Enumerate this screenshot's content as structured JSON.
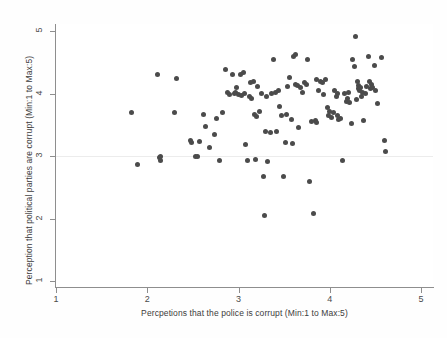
{
  "chart_data": {
    "type": "scatter",
    "title": "",
    "xlabel": "Percpetions that the police is corrupt (Min:1 to Max:5)",
    "ylabel": "Perception that political parties are corrupt (Min:1 to Max:5)",
    "xlim": [
      1,
      5
    ],
    "ylim": [
      1,
      5
    ],
    "xticks": [
      1,
      2,
      3,
      4,
      5
    ],
    "yticks": [
      1,
      2,
      3,
      4,
      5
    ],
    "xtick_labels": [
      "1",
      "2",
      "3",
      "4",
      "5"
    ],
    "ytick_labels": [
      "1",
      "2",
      "3",
      "4",
      "5"
    ],
    "grid": "horizontal-faint-at-3",
    "legend": null,
    "marker": {
      "shape": "circle",
      "color": "#4b4b4b",
      "size_px": 5
    },
    "n_points": 128,
    "points": [
      [
        1.83,
        3.7
      ],
      [
        1.89,
        2.86
      ],
      [
        2.11,
        4.3
      ],
      [
        2.13,
        2.97
      ],
      [
        2.14,
        2.93
      ],
      [
        2.14,
        3.0
      ],
      [
        2.32,
        4.24
      ],
      [
        2.3,
        3.7
      ],
      [
        2.47,
        3.25
      ],
      [
        2.49,
        3.22
      ],
      [
        2.53,
        2.99
      ],
      [
        2.55,
        2.99
      ],
      [
        2.57,
        3.23
      ],
      [
        2.62,
        3.66
      ],
      [
        2.64,
        3.48
      ],
      [
        2.68,
        3.13
      ],
      [
        2.74,
        3.35
      ],
      [
        2.76,
        3.6
      ],
      [
        2.79,
        2.93
      ],
      [
        2.82,
        3.7
      ],
      [
        2.86,
        4.38
      ],
      [
        2.88,
        4.02
      ],
      [
        2.9,
        3.98
      ],
      [
        2.93,
        4.3
      ],
      [
        2.96,
        4.0
      ],
      [
        2.97,
        4.02
      ],
      [
        3.0,
        3.98
      ],
      [
        3.02,
        4.3
      ],
      [
        3.05,
        4.33
      ],
      [
        3.07,
        4.0
      ],
      [
        3.08,
        3.18
      ],
      [
        3.1,
        2.93
      ],
      [
        3.12,
        3.95
      ],
      [
        3.14,
        3.92
      ],
      [
        3.16,
        4.2
      ],
      [
        3.18,
        3.66
      ],
      [
        3.19,
        2.95
      ],
      [
        3.2,
        3.63
      ],
      [
        3.23,
        3.71
      ],
      [
        3.25,
        4.0
      ],
      [
        3.27,
        2.68
      ],
      [
        3.28,
        2.05
      ],
      [
        3.3,
        3.4
      ],
      [
        3.32,
        2.92
      ],
      [
        3.35,
        3.37
      ],
      [
        3.38,
        4.55
      ],
      [
        3.4,
        4.02
      ],
      [
        3.42,
        3.4
      ],
      [
        3.45,
        3.8
      ],
      [
        3.47,
        3.65
      ],
      [
        3.49,
        2.67
      ],
      [
        3.52,
        3.22
      ],
      [
        3.54,
        4.12
      ],
      [
        3.56,
        4.25
      ],
      [
        3.58,
        3.58
      ],
      [
        3.59,
        3.2
      ],
      [
        3.6,
        4.6
      ],
      [
        3.62,
        4.63
      ],
      [
        3.63,
        4.15
      ],
      [
        3.65,
        4.13
      ],
      [
        3.66,
        3.45
      ],
      [
        3.68,
        4.1
      ],
      [
        3.7,
        4.02
      ],
      [
        3.72,
        4.18
      ],
      [
        3.74,
        4.15
      ],
      [
        3.76,
        4.55
      ],
      [
        3.78,
        2.6
      ],
      [
        3.8,
        3.55
      ],
      [
        3.82,
        2.08
      ],
      [
        3.84,
        3.57
      ],
      [
        3.86,
        4.22
      ],
      [
        3.88,
        4.05
      ],
      [
        3.9,
        4.2
      ],
      [
        3.92,
        4.18
      ],
      [
        3.95,
        4.22
      ],
      [
        3.97,
        3.78
      ],
      [
        3.99,
        3.65
      ],
      [
        4.0,
        3.72
      ],
      [
        4.02,
        3.62
      ],
      [
        4.04,
        3.7
      ],
      [
        4.05,
        4.05
      ],
      [
        4.07,
        3.95
      ],
      [
        4.09,
        4.0
      ],
      [
        4.1,
        3.58
      ],
      [
        4.12,
        3.6
      ],
      [
        4.14,
        2.93
      ],
      [
        4.16,
        4.0
      ],
      [
        4.18,
        3.88
      ],
      [
        4.2,
        4.02
      ],
      [
        4.22,
        3.86
      ],
      [
        4.24,
        3.52
      ],
      [
        4.25,
        4.55
      ],
      [
        4.27,
        4.44
      ],
      [
        4.28,
        4.92
      ],
      [
        4.3,
        4.2
      ],
      [
        4.31,
        4.13
      ],
      [
        4.32,
        4.08
      ],
      [
        4.33,
        4.05
      ],
      [
        4.34,
        4.1
      ],
      [
        4.35,
        3.96
      ],
      [
        4.36,
        4.02
      ],
      [
        4.37,
        3.57
      ],
      [
        4.4,
        4.12
      ],
      [
        4.42,
        4.6
      ],
      [
        4.44,
        4.2
      ],
      [
        4.45,
        4.08
      ],
      [
        4.46,
        4.14
      ],
      [
        4.47,
        4.1
      ],
      [
        4.49,
        4.45
      ],
      [
        4.5,
        4.05
      ],
      [
        4.52,
        3.84
      ],
      [
        4.57,
        4.57
      ],
      [
        4.6,
        3.25
      ],
      [
        4.61,
        3.08
      ],
      [
        3.36,
        4.0
      ],
      [
        3.31,
        3.95
      ],
      [
        3.21,
        4.12
      ],
      [
        3.13,
        4.18
      ],
      [
        2.98,
        4.1
      ],
      [
        3.03,
        3.97
      ],
      [
        3.44,
        4.05
      ],
      [
        3.53,
        3.67
      ],
      [
        3.85,
        3.53
      ],
      [
        4.08,
        3.65
      ],
      [
        4.19,
        3.92
      ],
      [
        4.29,
        3.9
      ],
      [
        4.39,
        4.0
      ],
      [
        3.93,
        3.98
      ]
    ]
  }
}
